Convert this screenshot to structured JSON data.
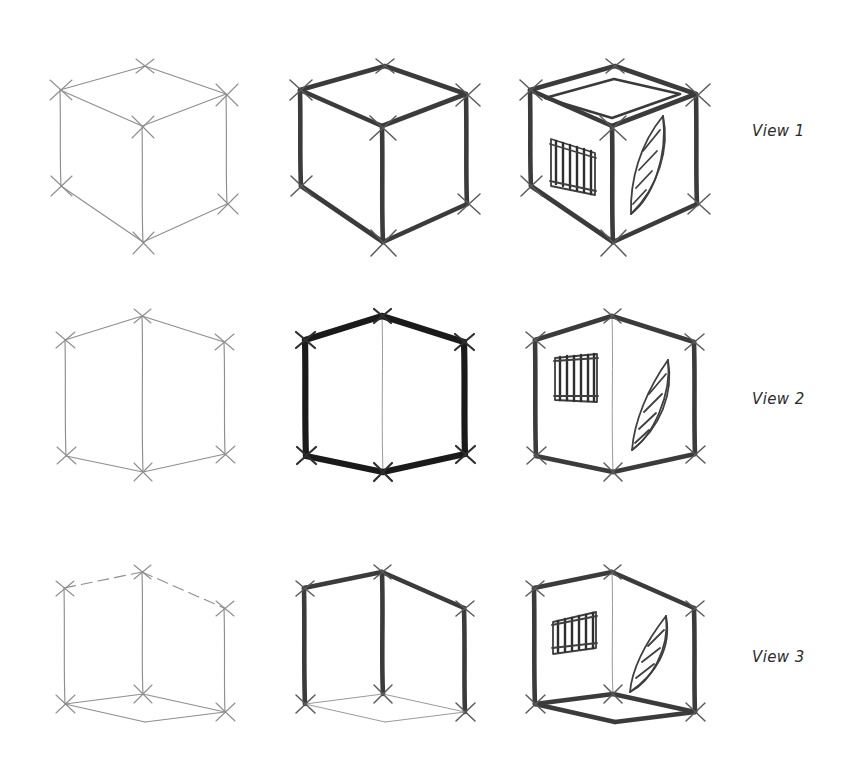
{
  "page": {
    "background_color": "#ffffff",
    "width": 848,
    "height": 769,
    "medium": "pencil sketch",
    "grid": {
      "rows": 3,
      "columns": 3
    }
  },
  "palette": {
    "paper": "#ffffff",
    "light_pencil": "#8e8e8e",
    "medium_pencil": "#6f6f6f",
    "dark_pencil": "#3b3b3b",
    "darkest_pencil": "#1a1a1a",
    "label_text": "#2b2b2b"
  },
  "labels": {
    "row_1": "View 1",
    "row_2": "View 2",
    "row_3": "View 3"
  },
  "rows": [
    {
      "id": "row-1",
      "label": "View 1",
      "viewpoint": "birds-eye (above horizon, top face visible)",
      "top_y": 18,
      "label_x": 752,
      "label_y": 122,
      "cells": [
        {
          "id": "r1c1",
          "stage": "construction-lines",
          "x": 30,
          "tone": "light",
          "details": false
        },
        {
          "id": "r1c2",
          "stage": "bold-outline",
          "x": 270,
          "tone": "dark",
          "details": false
        },
        {
          "id": "r1c3",
          "stage": "detailed",
          "x": 500,
          "tone": "dark",
          "details": true
        }
      ]
    },
    {
      "id": "row-2",
      "label": "View 2",
      "viewpoint": "eye-level (on horizon, no top or bottom face)",
      "top_y": 300,
      "label_x": 752,
      "label_y": 398,
      "cells": [
        {
          "id": "r2c1",
          "stage": "construction-lines",
          "x": 30,
          "tone": "light",
          "details": false
        },
        {
          "id": "r2c2",
          "stage": "bold-outline",
          "x": 270,
          "tone": "darkest",
          "details": false
        },
        {
          "id": "r2c3",
          "stage": "detailed",
          "x": 500,
          "tone": "dark",
          "details": true
        }
      ]
    },
    {
      "id": "row-3",
      "label": "View 3",
      "viewpoint": "worms-eye (below horizon, bottom face visible)",
      "top_y": 550,
      "label_x": 752,
      "label_y": 658,
      "cells": [
        {
          "id": "r3c1",
          "stage": "construction-lines",
          "x": 30,
          "tone": "light",
          "details": false
        },
        {
          "id": "r3c2",
          "stage": "bold-outline",
          "x": 270,
          "tone": "dark",
          "details": false
        },
        {
          "id": "r3c3",
          "stage": "detailed",
          "x": 500,
          "tone": "dark",
          "details": true
        }
      ]
    }
  ],
  "motifs": {
    "window": {
      "name": "barred-window",
      "face": "left",
      "bar_count": 6,
      "has_frame": true
    },
    "leaf": {
      "name": "leaf",
      "face": "right",
      "vein_count": 4,
      "has_midrib": true
    },
    "opening": {
      "name": "top-opening",
      "face": "top",
      "shape": "inset rhombus"
    }
  },
  "corner_marks": {
    "name": "registration-cross",
    "shape": "X tick through each cube vertex",
    "count_per_cube": 8
  }
}
